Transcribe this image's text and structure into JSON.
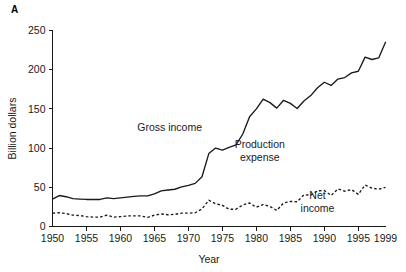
{
  "panel": {
    "label": "A"
  },
  "chart_data": {
    "type": "line",
    "title": "",
    "xlabel": "Year",
    "ylabel": "Billion dollars",
    "xlim": [
      1950,
      1999
    ],
    "ylim": [
      0,
      250
    ],
    "grid": false,
    "legend_position": "inline-annotations",
    "x_ticks": [
      1950,
      1955,
      1960,
      1965,
      1970,
      1975,
      1980,
      1985,
      1990,
      1995,
      1999
    ],
    "x_tick_labels": [
      "1950",
      "1955",
      "1960",
      "1965",
      "1970",
      "1975",
      "1980",
      "1985",
      "1990",
      "1995",
      "1999"
    ],
    "x_tick_marks": [
      1950,
      1955,
      1960,
      1965,
      1970,
      1975,
      1980,
      1985,
      1990,
      1995
    ],
    "y_ticks": [
      0,
      50,
      100,
      150,
      200,
      250
    ],
    "y_tick_labels": [
      "0",
      "50",
      "100",
      "150",
      "200",
      "250"
    ],
    "annotations": [
      {
        "text": "Gross income",
        "x": 1972.0,
        "y": 122.0,
        "align": "end"
      },
      {
        "text": "Production expense",
        "lines": [
          "Production",
          "expense"
        ],
        "x": 1980.5,
        "y": 100.0,
        "align": "middle"
      },
      {
        "text": "Net income",
        "lines": [
          "Net",
          "income"
        ],
        "x": 1989.0,
        "y": 35.0,
        "align": "middle"
      }
    ],
    "x": [
      1950,
      1951,
      1952,
      1953,
      1954,
      1955,
      1956,
      1957,
      1958,
      1959,
      1960,
      1961,
      1962,
      1963,
      1964,
      1965,
      1966,
      1967,
      1968,
      1969,
      1970,
      1971,
      1972,
      1973,
      1974,
      1975,
      1976,
      1977,
      1978,
      1979,
      1980,
      1981,
      1982,
      1983,
      1984,
      1985,
      1986,
      1987,
      1988,
      1989,
      1990,
      1991,
      1992,
      1993,
      1994,
      1995,
      1996,
      1997,
      1998,
      1999
    ],
    "series": [
      {
        "name": "Gross income",
        "style": "solid",
        "values": [
          35.0,
          39.5,
          38.0,
          35.5,
          35.0,
          34.5,
          34.5,
          34.5,
          36.5,
          35.5,
          36.5,
          37.5,
          38.5,
          39.0,
          39.0,
          41.5,
          45.5,
          46.5,
          47.5,
          50.5,
          52.5,
          55.0,
          63.5,
          93.0,
          100.0,
          97.5,
          101.0,
          104.0,
          118.0,
          140.0,
          150.0,
          162.5,
          158.0,
          151.0,
          161.0,
          157.0,
          150.5,
          160.0,
          167.0,
          177.0,
          184.0,
          180.0,
          188.0,
          190.0,
          196.0,
          198.0,
          216.0,
          213.0,
          215.0,
          235.0
        ]
      },
      {
        "name": "Net income",
        "style": "dashed",
        "values": [
          17.0,
          17.5,
          16.5,
          14.5,
          14.0,
          12.5,
          12.0,
          12.0,
          14.5,
          12.0,
          12.5,
          13.5,
          13.5,
          13.5,
          11.5,
          14.5,
          16.0,
          15.0,
          15.5,
          17.0,
          17.0,
          17.5,
          22.5,
          33.5,
          29.0,
          27.0,
          22.0,
          22.0,
          27.5,
          30.0,
          24.5,
          28.0,
          25.5,
          20.5,
          30.0,
          32.0,
          31.5,
          40.5,
          40.0,
          45.5,
          46.0,
          39.5,
          48.0,
          45.0,
          47.0,
          41.0,
          53.0,
          49.0,
          47.5,
          50.0
        ]
      }
    ]
  }
}
